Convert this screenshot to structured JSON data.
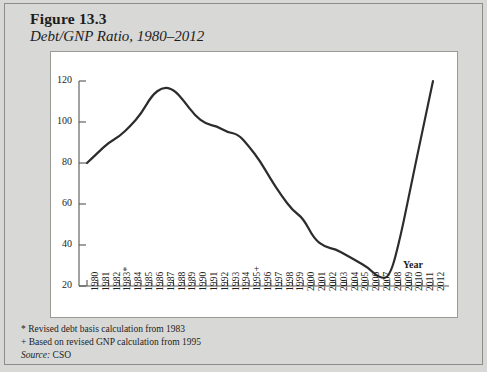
{
  "figure": {
    "number_label": "Figure 13.3",
    "subtitle": "Debt/GNP Ratio, 1980–2012"
  },
  "footnotes": [
    "* Revised debt basis calculation from 1983",
    "+ Based on revised GNP calculation from 1995"
  ],
  "source": {
    "label": "Source:",
    "value": "CSO"
  },
  "colors": {
    "page_background": "#d8d8d6",
    "panel_background": "#ffffff",
    "frame_border": "#8d8d8a",
    "axis": "#555553",
    "series_line": "#2c2c2c",
    "text": "#1d1d1d"
  },
  "chart_data": {
    "type": "line",
    "title": "Debt/GNP Ratio, 1980–2012",
    "xlabel": "Year",
    "ylabel": "Debt/GNP",
    "ylim": [
      20,
      120
    ],
    "yticks": [
      20,
      40,
      60,
      80,
      100,
      120
    ],
    "grid": false,
    "legend": null,
    "annotations": [
      "* Revised debt basis calculation from 1983",
      "+ Based on revised GNP calculation from 1995"
    ],
    "categories": [
      "1980",
      "1981",
      "1982",
      "1983*",
      "1984",
      "1985",
      "1986",
      "1987",
      "1988",
      "1989",
      "1990",
      "1991",
      "1992",
      "1993",
      "1994",
      "1995+",
      "1996",
      "1997",
      "1998",
      "1999",
      "2000",
      "2001",
      "2002",
      "2003",
      "2004",
      "2005",
      "2006",
      "2007",
      "2008",
      "2009",
      "2010",
      "2011",
      "2012"
    ],
    "x": [
      1980,
      1981,
      1982,
      1983,
      1984,
      1985,
      1986,
      1987,
      1988,
      1989,
      1990,
      1991,
      1992,
      1993,
      1994,
      1995,
      1996,
      1997,
      1998,
      1999,
      2000,
      2001,
      2002,
      2003,
      2004,
      2005,
      2006,
      2007,
      2008,
      2009,
      2010,
      2011,
      2012
    ],
    "series": [
      {
        "name": "Debt/GNP",
        "values": [
          80,
          85,
          90,
          93,
          98,
          104,
          113,
          117,
          116,
          110,
          103,
          99,
          98,
          95,
          94,
          88,
          81,
          72,
          64,
          57,
          53,
          43,
          39,
          38,
          35,
          32,
          29,
          24,
          24,
          44,
          70,
          95,
          120
        ]
      }
    ]
  }
}
